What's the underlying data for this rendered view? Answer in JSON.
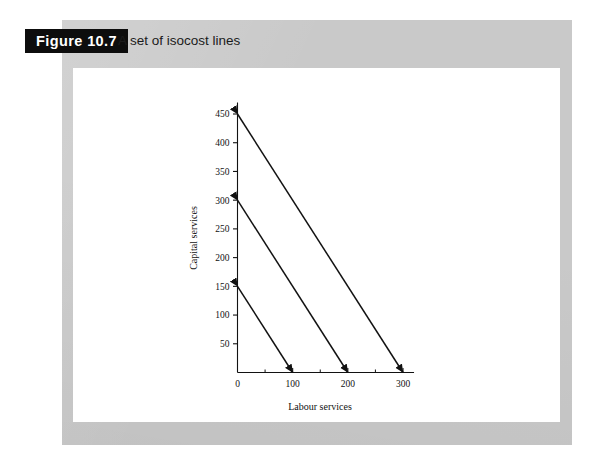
{
  "figure": {
    "badge_label": "Figure 10.7",
    "caption": "A set of isocost lines"
  },
  "colors": {
    "mat_grey": "#c9c9c9",
    "panel_white": "#ffffff",
    "badge_black": "#0d0d0d",
    "ink": "#121212"
  },
  "chart_data": {
    "type": "line",
    "title": "A set of isocost lines",
    "xlabel": "Labour services",
    "ylabel": "Capital services",
    "xlim": [
      0,
      320
    ],
    "ylim": [
      0,
      470
    ],
    "grid": false,
    "legend": false,
    "legend_position": "none",
    "x_ticks_major": [
      0,
      100,
      200,
      300
    ],
    "x_tick_labels": [
      "0",
      "100",
      "200",
      "300"
    ],
    "x_ticks_minor": [
      50,
      150,
      250
    ],
    "y_ticks_major": [
      50,
      100,
      150,
      200,
      250,
      300,
      350,
      400,
      450
    ],
    "y_tick_labels": [
      "50",
      "100",
      "150",
      "200",
      "250",
      "300",
      "350",
      "400",
      "450"
    ],
    "series": [
      {
        "name": "isocost-low",
        "x": [
          0,
          100
        ],
        "y": [
          150,
          0
        ],
        "slope": -1.5,
        "y_intercept": 150,
        "x_intercept": 100,
        "arrow_start": true,
        "arrow_end": true
      },
      {
        "name": "isocost-mid",
        "x": [
          0,
          200
        ],
        "y": [
          300,
          0
        ],
        "slope": -1.5,
        "y_intercept": 300,
        "x_intercept": 200,
        "arrow_start": true,
        "arrow_end": true
      },
      {
        "name": "isocost-high",
        "x": [
          0,
          300
        ],
        "y": [
          450,
          0
        ],
        "slope": -1.5,
        "y_intercept": 450,
        "x_intercept": 300,
        "arrow_start": true,
        "arrow_end": true
      }
    ]
  }
}
